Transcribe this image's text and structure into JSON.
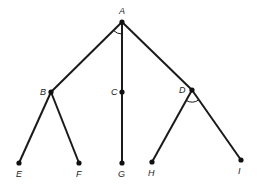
{
  "diagram": {
    "type": "tree",
    "colors": {
      "line": "#1a1a1a",
      "node": "#111111",
      "background": "#ffffff"
    },
    "nodes": [
      {
        "id": "A",
        "label": "A",
        "x": 122,
        "y": 22,
        "lx": 119,
        "ly": 14
      },
      {
        "id": "B",
        "label": "B",
        "x": 51,
        "y": 92,
        "lx": 40,
        "ly": 95
      },
      {
        "id": "C",
        "label": "C",
        "x": 122,
        "y": 92,
        "lx": 111,
        "ly": 95
      },
      {
        "id": "D",
        "label": "D",
        "x": 192,
        "y": 90,
        "lx": 179,
        "ly": 93
      },
      {
        "id": "E",
        "label": "E",
        "x": 19,
        "y": 163,
        "lx": 16,
        "ly": 177
      },
      {
        "id": "F",
        "label": "F",
        "x": 79,
        "y": 163,
        "lx": 76,
        "ly": 177
      },
      {
        "id": "G",
        "label": "G",
        "x": 122,
        "y": 163,
        "lx": 118,
        "ly": 177
      },
      {
        "id": "H",
        "label": "H",
        "x": 152,
        "y": 162,
        "lx": 148,
        "ly": 176
      },
      {
        "id": "I",
        "label": "I",
        "x": 241,
        "y": 160,
        "lx": 238,
        "ly": 174
      }
    ],
    "edges": [
      [
        "A",
        "B"
      ],
      [
        "A",
        "C"
      ],
      [
        "A",
        "D"
      ],
      [
        "B",
        "E"
      ],
      [
        "B",
        "F"
      ],
      [
        "C",
        "G"
      ],
      [
        "D",
        "H"
      ],
      [
        "D",
        "I"
      ]
    ],
    "angle_arcs": [
      {
        "at": "A",
        "between": [
          "B",
          "C"
        ]
      },
      {
        "at": "D",
        "between": [
          "H",
          "I"
        ]
      }
    ]
  }
}
